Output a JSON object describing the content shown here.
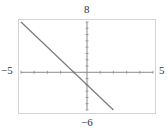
{
  "window": {
    "xmin_label": "−5",
    "xmax_label": "5",
    "ymax_label": "8",
    "ymin_label": "−6"
  },
  "colors": {
    "frame": "#d4d4d4",
    "axis": "#8a8a8a",
    "curve": "#7a7a7a",
    "label": "#333333"
  },
  "chart_data": {
    "type": "line",
    "title": "",
    "xlabel": "",
    "ylabel": "",
    "xlim": [
      -5,
      5
    ],
    "ylim": [
      -6,
      8
    ],
    "xscale_ticks": 1,
    "yscale_ticks": 1,
    "grid": false,
    "series": [
      {
        "name": "y = -2x - 2",
        "x": [
          -5,
          2
        ],
        "y": [
          8,
          -6
        ]
      }
    ],
    "annotations": [
      "-5",
      "5",
      "8",
      "-6"
    ]
  }
}
